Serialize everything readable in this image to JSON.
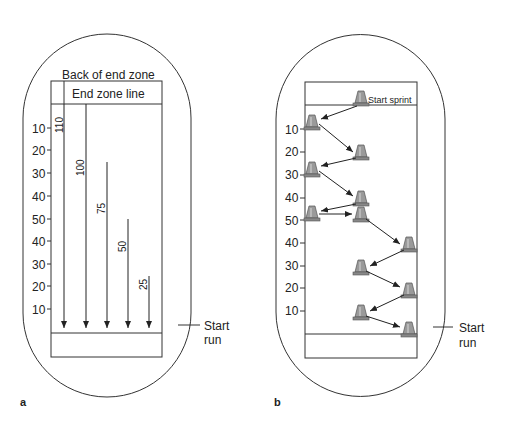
{
  "panel_a": {
    "label": "a",
    "back_of_end_zone": "Back of end zone",
    "end_zone_line": "End zone line",
    "yard_labels": [
      "10",
      "20",
      "30",
      "40",
      "50",
      "40",
      "30",
      "20",
      "10"
    ],
    "runs": [
      "110",
      "100",
      "75",
      "50",
      "25"
    ],
    "start_label_1": "Start",
    "start_label_2": "run"
  },
  "panel_b": {
    "label": "b",
    "start_sprint": "Start sprint",
    "yard_labels": [
      "10",
      "20",
      "30",
      "40",
      "50",
      "40",
      "30",
      "20",
      "10"
    ],
    "start_label_1": "Start",
    "start_label_2": "run"
  },
  "colors": {
    "line": "#2a2a2a",
    "cone": "#8c8c8c"
  }
}
